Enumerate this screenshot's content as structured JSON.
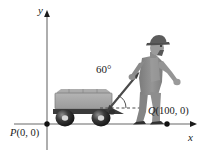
{
  "figure": {
    "background_color": "#ffffff",
    "ink_color": "#1a1a1a"
  },
  "axes": {
    "y_label": "y",
    "x_label": "x",
    "origin_x": 47,
    "origin_y": 124,
    "x_axis_end": 196,
    "y_axis_top": 12,
    "line_color": "#8a8a8a",
    "arrow_color": "#1a1a1a"
  },
  "points": [
    {
      "name": "P",
      "label_var": "P",
      "label_coords": "(0, 0)",
      "x": 0,
      "y": 0,
      "pixel_x": 47,
      "pixel_y": 124
    },
    {
      "name": "Q",
      "label_var": "Q",
      "label_coords": "(100, 0)",
      "x": 100,
      "y": 0,
      "pixel_x": 167,
      "pixel_y": 124
    }
  ],
  "angle": {
    "value": "60",
    "unit": "°",
    "label": "60°",
    "degrees": 60
  },
  "wagon": {
    "body_color": "#a8a8a8",
    "frame_color": "#3d3d3d",
    "wheel_color": "#2b2b2b",
    "load_color": "#9d9d9d"
  },
  "person": {
    "body_color": "#8f8f8f",
    "shade_color": "#6e6e6e",
    "hat_color": "#5c5c5c",
    "shoe_color": "#3a3a3a"
  },
  "handle": {
    "color": "#4a4a4a",
    "style": "double-headed arrow",
    "reference_line": "dashed horizontal"
  }
}
